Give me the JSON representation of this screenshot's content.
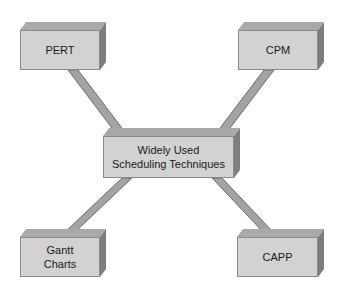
{
  "diagram": {
    "type": "hub-and-spoke",
    "center": {
      "label": "Widely Used\nScheduling Techniques"
    },
    "nodes": [
      {
        "id": "pert",
        "label": "PERT",
        "position": "top-left"
      },
      {
        "id": "cpm",
        "label": "CPM",
        "position": "top-right"
      },
      {
        "id": "gantt",
        "label": "Gantt\nCharts",
        "position": "bottom-left"
      },
      {
        "id": "capp",
        "label": "CAPP",
        "position": "bottom-right"
      }
    ],
    "colors": {
      "front": "#d2d2d2",
      "top": "#a9a9a9",
      "side": "#7e7e7e",
      "connector": "#a0a0a0",
      "connector_edge": "#6e6e6e"
    }
  }
}
